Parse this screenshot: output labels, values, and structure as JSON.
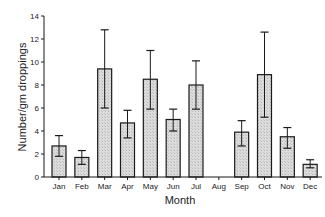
{
  "chart_data": {
    "type": "bar",
    "title": "",
    "xlabel": "Month",
    "ylabel": "Number/gm droppings",
    "ylim": [
      0,
      14
    ],
    "yticks": [
      0,
      2,
      4,
      6,
      8,
      10,
      12,
      14
    ],
    "grid": false,
    "legend": null,
    "categories": [
      "Jan",
      "Feb",
      "Mar",
      "Apr",
      "May",
      "Jun",
      "Jul",
      "Aug",
      "Sep",
      "Oct",
      "Nov",
      "Dec"
    ],
    "values": [
      2.7,
      1.7,
      9.4,
      4.7,
      8.5,
      5.0,
      8.0,
      0,
      3.9,
      8.9,
      3.5,
      1.1
    ],
    "error_low": [
      1.8,
      1.1,
      6.0,
      3.4,
      5.9,
      4.0,
      5.9,
      null,
      2.7,
      5.2,
      2.5,
      0.8
    ],
    "error_high": [
      3.6,
      2.3,
      12.8,
      5.8,
      11.0,
      5.9,
      10.1,
      null,
      4.9,
      12.6,
      4.3,
      1.5
    ],
    "colors": {
      "bar_fill": "#d4d4d4",
      "bar_stroke": "#1a1a1a",
      "axis": "#1a1a1a"
    }
  }
}
